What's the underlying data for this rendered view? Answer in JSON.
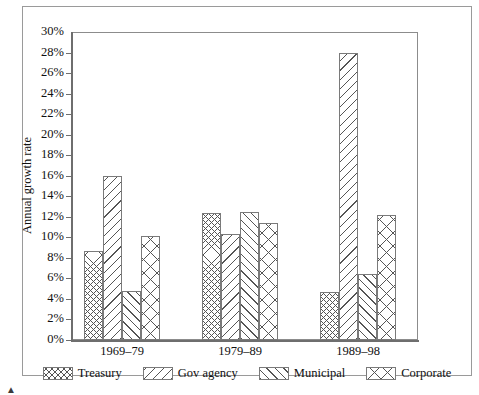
{
  "chart_data": {
    "type": "bar",
    "title": "",
    "xlabel": "",
    "ylabel": "Annual growth rate",
    "categories": [
      "1969–79",
      "1979–89",
      "1989–98"
    ],
    "series": [
      {
        "name": "Treasury",
        "pattern": "dense-crosshatch",
        "values": [
          8.7,
          12.4,
          4.7
        ]
      },
      {
        "name": "Gov agency",
        "pattern": "backslash-diagonal",
        "values": [
          16.0,
          10.3,
          28.0
        ]
      },
      {
        "name": "Municipal",
        "pattern": "forwardslash-diagonal",
        "values": [
          4.8,
          12.5,
          6.4
        ]
      },
      {
        "name": "Corporate",
        "pattern": "large-crosshatch",
        "values": [
          10.1,
          11.4,
          12.2
        ]
      }
    ],
    "ylim": [
      0,
      30
    ],
    "ytick_step": 2,
    "ytick_labels": [
      "0%",
      "2%",
      "4%",
      "6%",
      "8%",
      "10%",
      "12%",
      "14%",
      "16%",
      "18%",
      "20%",
      "22%",
      "24%",
      "26%",
      "28%",
      "30%"
    ],
    "ytick_values": [
      0,
      2,
      4,
      6,
      8,
      10,
      12,
      14,
      16,
      18,
      20,
      22,
      24,
      26,
      28,
      30
    ],
    "grid": false,
    "legend_position": "bottom",
    "value_suffix": "%"
  },
  "legend": {
    "items": [
      {
        "label": "Treasury"
      },
      {
        "label": "Gov agency"
      },
      {
        "label": "Municipal"
      },
      {
        "label": "Corporate"
      }
    ]
  },
  "colors": {
    "axis": "#6e6e6e",
    "frame": "#9a9a9a",
    "pattern": "#555555",
    "text": "#101010",
    "background": "#ffffff"
  }
}
